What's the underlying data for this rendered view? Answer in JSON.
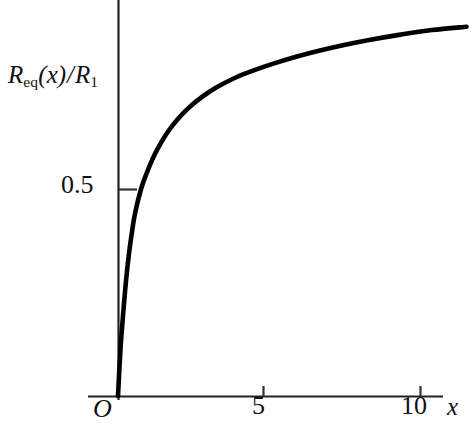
{
  "chart_data": {
    "type": "line",
    "title": "",
    "subtitle": "",
    "xlabel": "x",
    "ylabel": "R_eq(x)/R_1",
    "ylabel_parts": {
      "main_symbol": "R",
      "subscript": "eq",
      "argument": "(x)",
      "divider": "/",
      "denominator_symbol": "R",
      "denominator_subscript": "1"
    },
    "origin_label": "O",
    "xlim": [
      0,
      11.7
    ],
    "ylim": [
      0,
      0.96
    ],
    "xticks": [
      5,
      10
    ],
    "xtick_labels": [
      "5",
      "10"
    ],
    "yticks": [
      0.5
    ],
    "ytick_labels": [
      "0.5"
    ],
    "grid": false,
    "legend": null,
    "axis_color": "#111111",
    "curve_color": "#000000",
    "background_color": "#ffffff",
    "series": [
      {
        "name": "R_eq(x)/R_1",
        "x": [
          0,
          0.08,
          0.16,
          0.25,
          0.35,
          0.45,
          0.55,
          0.73,
          0.9,
          1.1,
          1.3,
          1.6,
          1.9,
          2.2,
          2.5,
          2.9,
          3.3,
          3.8,
          4.3,
          5.0,
          5.7,
          6.4,
          7.2,
          8.0,
          9.0,
          10.0,
          11.1
        ],
        "y": [
          0.0,
          0.115,
          0.195,
          0.275,
          0.345,
          0.4,
          0.445,
          0.5,
          0.537,
          0.574,
          0.604,
          0.641,
          0.67,
          0.694,
          0.714,
          0.736,
          0.754,
          0.773,
          0.788,
          0.806,
          0.822,
          0.836,
          0.85,
          0.862,
          0.875,
          0.886,
          0.894
        ],
        "asymptote": 0.915,
        "value_at_x5": 0.87,
        "value_at_x10": 0.905,
        "half_value_x": 0.73
      }
    ],
    "annotations": []
  },
  "figure": {
    "axes": {
      "y_axis_x_px": 118,
      "x_axis_y_px": 396,
      "y_axis_top_px": 0,
      "x_axis_right_px": 443
    }
  }
}
